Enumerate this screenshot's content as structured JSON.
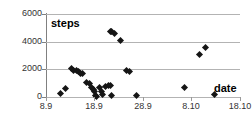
{
  "chart_data": {
    "type": "scatter",
    "title": "",
    "xlabel": "date",
    "ylabel": "steps",
    "grid": true,
    "legend": null,
    "xtick_labels": [
      "8.9",
      "18.9",
      "28.9",
      "8.10",
      "18.10"
    ],
    "ytick_labels": [
      "0",
      "2000",
      "4000",
      "6000"
    ],
    "ytick_values": [
      0,
      2000,
      4000,
      6000
    ],
    "ylim": [
      0,
      6000
    ],
    "xlim_labels": [
      "8.9",
      "18.10"
    ],
    "marker": "diamond",
    "marker_color": "#151515",
    "grid_color": "#b3b3b3",
    "axis_color": "#808080",
    "series": [
      {
        "name": "steps",
        "points": [
          {
            "x_label": "11.9",
            "x": 11.0,
            "y": 280
          },
          {
            "x_label": "12.9",
            "x": 12.0,
            "y": 650
          },
          {
            "x_label": "13.9",
            "x": 13.2,
            "y": 2050
          },
          {
            "x_label": "13.9",
            "x": 13.6,
            "y": 1950
          },
          {
            "x_label": "14.9",
            "x": 14.2,
            "y": 1900
          },
          {
            "x_label": "14.9",
            "x": 14.6,
            "y": 1830
          },
          {
            "x_label": "15.9",
            "x": 15.2,
            "y": 1700
          },
          {
            "x_label": "15.9",
            "x": 15.6,
            "y": 1680
          },
          {
            "x_label": "16.9",
            "x": 16.4,
            "y": 1050
          },
          {
            "x_label": "16.9",
            "x": 16.9,
            "y": 980
          },
          {
            "x_label": "17.9",
            "x": 17.4,
            "y": 700
          },
          {
            "x_label": "17.9",
            "x": 17.8,
            "y": 560
          },
          {
            "x_label": "18.9",
            "x": 18.1,
            "y": 430
          },
          {
            "x_label": "18.9",
            "x": 18.2,
            "y": 120
          },
          {
            "x_label": "18.9",
            "x": 18.4,
            "y": 60
          },
          {
            "x_label": "19.9",
            "x": 19.1,
            "y": 700
          },
          {
            "x_label": "19.9",
            "x": 19.4,
            "y": 430
          },
          {
            "x_label": "19.9",
            "x": 19.7,
            "y": 200
          },
          {
            "x_label": "20.9",
            "x": 20.3,
            "y": 790
          },
          {
            "x_label": "20.9",
            "x": 20.8,
            "y": 800
          },
          {
            "x_label": "21.9",
            "x": 21.4,
            "y": 800
          },
          {
            "x_label": "21.9",
            "x": 21.6,
            "y": 110
          },
          {
            "x_label": "21.9",
            "x": 21.2,
            "y": 4730
          },
          {
            "x_label": "21.9",
            "x": 21.6,
            "y": 4700
          },
          {
            "x_label": "22.9",
            "x": 22.2,
            "y": 4580
          },
          {
            "x_label": "23.9",
            "x": 23.3,
            "y": 4080
          },
          {
            "x_label": "24.9",
            "x": 24.6,
            "y": 1880
          },
          {
            "x_label": "25.9",
            "x": 25.2,
            "y": 1870
          },
          {
            "x_label": "26.9",
            "x": 26.6,
            "y": 90
          },
          {
            "x_label": "6.10",
            "x": 36.6,
            "y": 680
          },
          {
            "x_label": "9.10",
            "x": 39.6,
            "y": 3100
          },
          {
            "x_label": "10.10",
            "x": 40.8,
            "y": 3600
          },
          {
            "x_label": "12.10",
            "x": 42.8,
            "y": 200
          }
        ]
      }
    ]
  }
}
